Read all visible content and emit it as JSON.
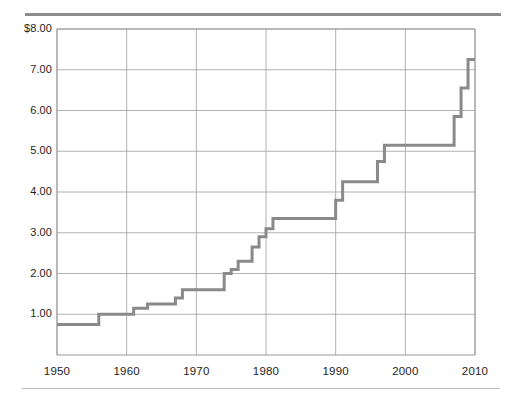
{
  "chart_data": {
    "type": "line",
    "step": "post",
    "title": "",
    "subtitle": "",
    "xlabel": "",
    "ylabel": "",
    "xlim": [
      1950,
      2010
    ],
    "ylim": [
      0.0,
      8.0
    ],
    "grid": true,
    "legend": null,
    "x_ticks": [
      1950,
      1960,
      1970,
      1980,
      1990,
      2000,
      2010
    ],
    "x_tick_labels": [
      "1950",
      "1960",
      "1970",
      "1980",
      "1990",
      "2000",
      "2010"
    ],
    "y_ticks": [
      1.0,
      2.0,
      3.0,
      4.0,
      5.0,
      6.0,
      7.0,
      8.0
    ],
    "y_tick_labels": [
      "1.00",
      "2.00",
      "3.00",
      "4.00",
      "5.00",
      "6.00",
      "7.00",
      "$8.00"
    ],
    "series": [
      {
        "name": "Minimum wage",
        "color": "#8a8a8a",
        "line_width": 3,
        "x": [
          1950,
          1956,
          1961,
          1963,
          1967,
          1968,
          1974,
          1975,
          1976,
          1978,
          1979,
          1980,
          1981,
          1990,
          1991,
          1996,
          1997,
          2007,
          2008,
          2009,
          2010
        ],
        "y": [
          0.75,
          1.0,
          1.15,
          1.25,
          1.4,
          1.6,
          2.0,
          2.1,
          2.3,
          2.65,
          2.9,
          3.1,
          3.35,
          3.8,
          4.25,
          4.75,
          5.15,
          5.85,
          6.55,
          7.25,
          7.25
        ]
      }
    ],
    "points": [
      {
        "year": 1950,
        "value": 0.75
      },
      {
        "year": 1956,
        "value": 1.0
      },
      {
        "year": 1961,
        "value": 1.15
      },
      {
        "year": 1963,
        "value": 1.25
      },
      {
        "year": 1967,
        "value": 1.4
      },
      {
        "year": 1968,
        "value": 1.6
      },
      {
        "year": 1974,
        "value": 2.0
      },
      {
        "year": 1975,
        "value": 2.1
      },
      {
        "year": 1976,
        "value": 2.3
      },
      {
        "year": 1978,
        "value": 2.65
      },
      {
        "year": 1979,
        "value": 2.9
      },
      {
        "year": 1980,
        "value": 3.1
      },
      {
        "year": 1981,
        "value": 3.35
      },
      {
        "year": 1990,
        "value": 3.8
      },
      {
        "year": 1991,
        "value": 4.25
      },
      {
        "year": 1996,
        "value": 4.75
      },
      {
        "year": 1997,
        "value": 5.15
      },
      {
        "year": 2007,
        "value": 5.85
      },
      {
        "year": 2008,
        "value": 6.55
      },
      {
        "year": 2009,
        "value": 7.25
      }
    ],
    "colors": {
      "line": "#8a8a8a",
      "grid": "#a9a9a9",
      "axis": "#9a9a9a",
      "rule_top": "#8d8d8d",
      "rule_bottom": "#bcbcbc",
      "text": "#1e1e1e",
      "background": "#ffffff"
    }
  }
}
